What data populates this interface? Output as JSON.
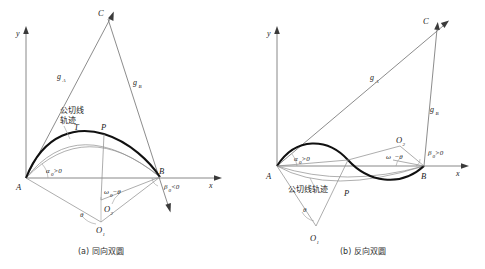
{
  "figure": {
    "panels": [
      {
        "id": "panel-a",
        "caption": "(a) 同向双圆",
        "axes": {
          "x_label": "x",
          "y_label": "y"
        },
        "points": [
          {
            "name": "A",
            "label": "A"
          },
          {
            "name": "B",
            "label": "B"
          },
          {
            "name": "C",
            "label": "C"
          },
          {
            "name": "P",
            "label": "P"
          },
          {
            "name": "T",
            "label": "T"
          },
          {
            "name": "O1",
            "label": "O",
            "sub": "1"
          },
          {
            "name": "O2",
            "label": "O",
            "sub": "2"
          }
        ],
        "rays": [
          {
            "name": "gA",
            "label": "g",
            "sub": "A"
          },
          {
            "name": "gB",
            "label": "g",
            "sub": "B"
          }
        ],
        "angles": [
          {
            "name": "alpha0",
            "label": "α",
            "sub": "0",
            "rel": ">0"
          },
          {
            "name": "beta0",
            "label": "β",
            "sub": "0",
            "rel": "<0"
          },
          {
            "name": "omega0_minus_theta",
            "label": "ω",
            "sub": "0",
            "rel": "−θ"
          },
          {
            "name": "theta",
            "label": "θ",
            "sub": "",
            "rel": ""
          }
        ],
        "locus_label": {
          "line1": "公切线",
          "line2": "轨迹"
        }
      },
      {
        "id": "panel-b",
        "caption": "(b) 反向双圆",
        "axes": {
          "x_label": "x",
          "y_label": "y"
        },
        "points": [
          {
            "name": "A",
            "label": "A"
          },
          {
            "name": "B",
            "label": "B"
          },
          {
            "name": "C",
            "label": "C"
          },
          {
            "name": "P",
            "label": "P"
          },
          {
            "name": "O1",
            "label": "O",
            "sub": "1"
          },
          {
            "name": "O2",
            "label": "O",
            "sub": "2"
          }
        ],
        "rays": [
          {
            "name": "gA",
            "label": "g",
            "sub": "A"
          },
          {
            "name": "gB",
            "label": "g",
            "sub": "B"
          }
        ],
        "angles": [
          {
            "name": "alpha0",
            "label": "α",
            "sub": "0",
            "rel": ">0"
          },
          {
            "name": "beta0",
            "label": "β",
            "sub": "0",
            "rel": ">0"
          },
          {
            "name": "omega0_minus_theta",
            "label": "ω",
            "sub": "0",
            "rel": "−θ"
          },
          {
            "name": "theta",
            "label": "θ",
            "sub": "",
            "rel": ""
          }
        ],
        "locus_label": {
          "line1": "公切线轨迹",
          "line2": ""
        }
      }
    ]
  }
}
